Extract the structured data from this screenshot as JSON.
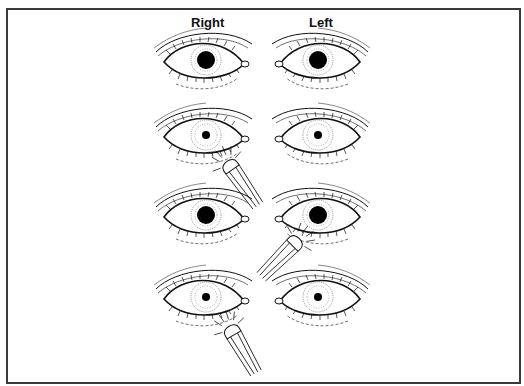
{
  "figure": {
    "columns": [
      {
        "label": "Right",
        "x": 204
      },
      {
        "label": "Left",
        "x": 320
      }
    ],
    "colors": {
      "ink": "#111111",
      "frame": "#3a3a3a",
      "background": "#ffffff"
    },
    "rows": [
      {
        "y": 60,
        "right_pupil": "dilated",
        "left_pupil": "dilated",
        "light_on": "none"
      },
      {
        "y": 135,
        "right_pupil": "constricted",
        "left_pupil": "constricted",
        "light_on": "right"
      },
      {
        "y": 215,
        "right_pupil": "dilated",
        "left_pupil": "dilated",
        "light_on": "left"
      },
      {
        "y": 297,
        "right_pupil": "constricted",
        "left_pupil": "constricted",
        "light_on": "right"
      }
    ],
    "icons": [
      "eye-icon",
      "penlight-icon"
    ]
  }
}
